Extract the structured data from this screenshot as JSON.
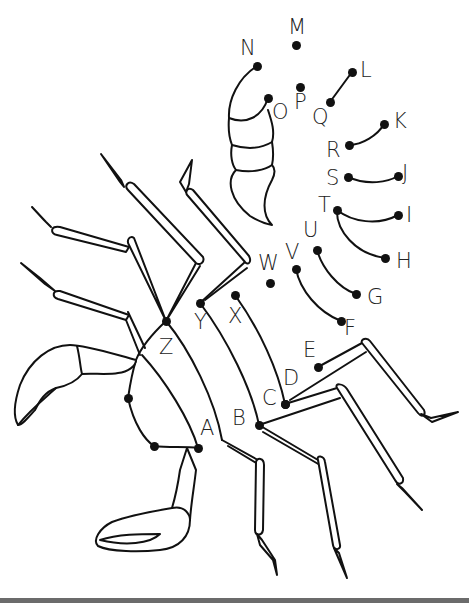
{
  "colors": {
    "ink": "#111111",
    "background": "#ffffff",
    "bottom_bar": "#6b6b6b"
  },
  "dots": [
    {
      "id": "A",
      "x": 198,
      "y": 448,
      "lx": 200,
      "ly": 418
    },
    {
      "id": "B",
      "x": 259,
      "y": 425,
      "lx": 232,
      "ly": 408
    },
    {
      "id": "C",
      "x": 285,
      "y": 404,
      "lx": 262,
      "ly": 388
    },
    {
      "id": "D",
      "x": 285,
      "y": 404,
      "lx": 283,
      "ly": 368
    },
    {
      "id": "E",
      "x": 318,
      "y": 367,
      "lx": 303,
      "ly": 340
    },
    {
      "id": "F",
      "x": 341,
      "y": 321,
      "lx": 344,
      "ly": 318
    },
    {
      "id": "G",
      "x": 356,
      "y": 294,
      "lx": 367,
      "ly": 287
    },
    {
      "id": "H",
      "x": 385,
      "y": 258,
      "lx": 396,
      "ly": 251
    },
    {
      "id": "I",
      "x": 398,
      "y": 215,
      "lx": 406,
      "ly": 205
    },
    {
      "id": "J",
      "x": 398,
      "y": 176,
      "lx": 402,
      "ly": 163
    },
    {
      "id": "K",
      "x": 384,
      "y": 124,
      "lx": 393,
      "ly": 111
    },
    {
      "id": "L",
      "x": 352,
      "y": 72,
      "lx": 360,
      "ly": 60
    },
    {
      "id": "M",
      "x": 296,
      "y": 45,
      "lx": 288,
      "ly": 17
    },
    {
      "id": "N",
      "x": 257,
      "y": 66,
      "lx": 240,
      "ly": 38
    },
    {
      "id": "O",
      "x": 268,
      "y": 98,
      "lx": 272,
      "ly": 102
    },
    {
      "id": "P",
      "x": 300,
      "y": 87,
      "lx": 294,
      "ly": 92
    },
    {
      "id": "Q",
      "x": 330,
      "y": 102,
      "lx": 312,
      "ly": 107
    },
    {
      "id": "R",
      "x": 349,
      "y": 145,
      "lx": 326,
      "ly": 140
    },
    {
      "id": "S",
      "x": 348,
      "y": 177,
      "lx": 326,
      "ly": 168
    },
    {
      "id": "T",
      "x": 337,
      "y": 210,
      "lx": 318,
      "ly": 195
    },
    {
      "id": "U",
      "x": 317,
      "y": 250,
      "lx": 303,
      "ly": 220
    },
    {
      "id": "V",
      "x": 296,
      "y": 269,
      "lx": 285,
      "ly": 242
    },
    {
      "id": "W",
      "x": 270,
      "y": 283,
      "lx": 258,
      "ly": 253
    },
    {
      "id": "X",
      "x": 235,
      "y": 295,
      "lx": 228,
      "ly": 306
    },
    {
      "id": "Y",
      "x": 200,
      "y": 303,
      "lx": 194,
      "ly": 312
    },
    {
      "id": "Z",
      "x": 166,
      "y": 321,
      "lx": 159,
      "ly": 337
    },
    {
      "id": "",
      "x": 128,
      "y": 398,
      "lx": 0,
      "ly": 0
    },
    {
      "id": "",
      "x": 154,
      "y": 446,
      "lx": 0,
      "ly": 0
    }
  ]
}
